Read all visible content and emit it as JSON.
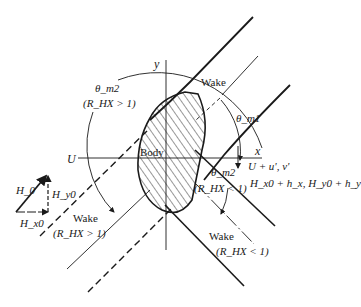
{
  "figure": {
    "type": "MHD wake diagram around a body",
    "axes": {
      "x_label": "x",
      "y_label": "y"
    },
    "body_label": "Body",
    "free_stream_label": "U",
    "perturbed_flow_label": "U + u', v'",
    "perturbed_field_label": "H_x0 + h_x, H_y0 + h_y",
    "angles": {
      "theta_m1": "θ_m1",
      "theta_m2_upper": "θ_m2",
      "theta_m2_lower": "θ_m2"
    },
    "conditions": {
      "gt": "(R_HX > 1)",
      "lt": "(R_HX < 1)"
    },
    "wakes": [
      {
        "label": "Wake",
        "condition": ""
      },
      {
        "label": "Wake",
        "condition": "(R_HX > 1)"
      },
      {
        "label": "Wake",
        "condition": "(R_HX < 1)"
      }
    ],
    "field_triangle": {
      "hypotenuse": "H_0",
      "vertical": "H_y0",
      "horizontal": "H_x0"
    }
  },
  "colors": {
    "ink": "#1a1a1a",
    "background": "#ffffff"
  }
}
